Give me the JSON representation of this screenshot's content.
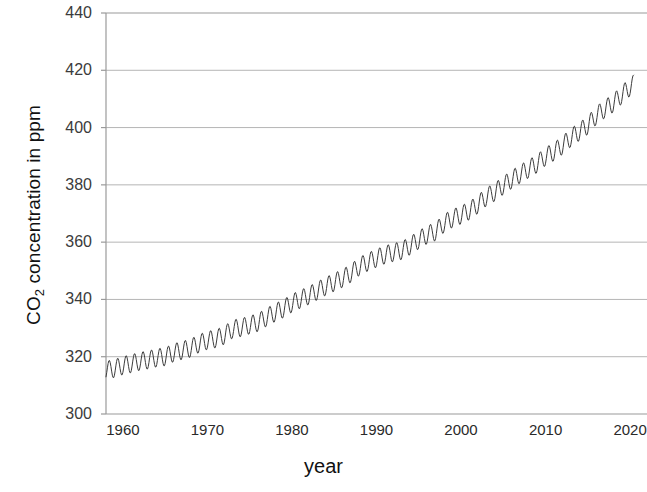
{
  "chart_data": {
    "type": "line",
    "title": "",
    "subtitle": "",
    "xlabel": "year",
    "ylabel": "CO2 concentration in ppm",
    "ylabel_parts": {
      "pre": "CO",
      "sub": "2",
      "post": " concentration in ppm"
    },
    "xlim": [
      1958,
      2022
    ],
    "ylim": [
      300,
      440
    ],
    "xticks": [
      1960,
      1970,
      1980,
      1990,
      2000,
      2010,
      2020
    ],
    "yticks": [
      300,
      320,
      340,
      360,
      380,
      400,
      420,
      440
    ],
    "grid": "horizontal",
    "legend": "none",
    "line_color": "#3c3c3c",
    "axis_color": "#9a9a9a",
    "grid_color": "#b5b5b5",
    "series": [
      {
        "name": "Atmospheric CO2 (monthly mean)",
        "description": "Rising trend with annual seasonal sawtooth oscillation of roughly 6 ppm peak-to-trough",
        "seasonal_amplitude_ppm": 3.2,
        "x": [
          1958,
          1959,
          1960,
          1961,
          1962,
          1963,
          1964,
          1965,
          1966,
          1967,
          1968,
          1969,
          1970,
          1971,
          1972,
          1973,
          1974,
          1975,
          1976,
          1977,
          1978,
          1979,
          1980,
          1981,
          1982,
          1983,
          1984,
          1985,
          1986,
          1987,
          1988,
          1989,
          1990,
          1991,
          1992,
          1993,
          1994,
          1995,
          1996,
          1997,
          1998,
          1999,
          2000,
          2001,
          2002,
          2003,
          2004,
          2005,
          2006,
          2007,
          2008,
          2009,
          2010,
          2011,
          2012,
          2013,
          2014,
          2015,
          2016,
          2017,
          2018,
          2019,
          2020
        ],
        "annual_mean": [
          315.3,
          315.9,
          316.9,
          317.6,
          318.4,
          318.9,
          319.6,
          320.0,
          321.4,
          322.2,
          323.0,
          324.6,
          325.7,
          326.3,
          327.5,
          329.7,
          330.2,
          331.1,
          332.0,
          333.8,
          335.4,
          336.8,
          338.7,
          340.1,
          341.4,
          343.0,
          344.6,
          346.0,
          347.4,
          349.2,
          351.6,
          353.1,
          354.4,
          355.6,
          356.4,
          357.1,
          358.8,
          360.8,
          362.6,
          363.7,
          366.6,
          368.3,
          369.5,
          371.0,
          373.2,
          375.8,
          377.5,
          379.8,
          381.9,
          383.8,
          385.6,
          387.4,
          389.9,
          391.6,
          393.8,
          396.5,
          398.6,
          400.8,
          404.2,
          406.5,
          408.5,
          411.4,
          414.2
        ]
      }
    ]
  }
}
